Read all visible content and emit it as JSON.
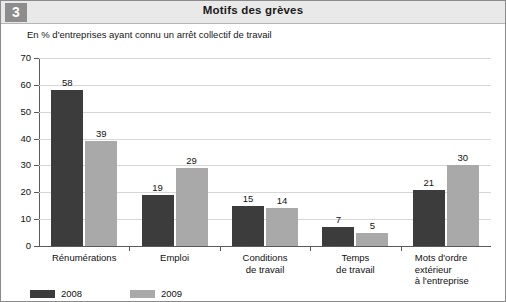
{
  "badge": {
    "number": "3"
  },
  "header": {
    "title": "Motifs des grèves"
  },
  "subtitle": "En % d'entreprises ayant connu un arrêt collectif de travail",
  "legend": {
    "items": [
      {
        "label": "2008",
        "color": "#3c3c3c"
      },
      {
        "label": "2009",
        "color": "#a9a9a9"
      }
    ]
  },
  "chart_data": {
    "type": "bar",
    "title": "Motifs des grèves",
    "subtitle": "En % d'entreprises ayant connu un arrêt collectif de travail",
    "xlabel": "",
    "ylabel": "",
    "ylim": [
      0,
      70
    ],
    "yticks": [
      0,
      10,
      20,
      30,
      40,
      50,
      60,
      70
    ],
    "ytick_labels": [
      "0",
      "10",
      "20",
      "30",
      "40",
      "50",
      "60",
      "70"
    ],
    "grid": true,
    "legend_position": "bottom-left",
    "categories": [
      "Rénumérations",
      "Emploi",
      "Conditions de travail",
      "Temps de travail",
      "Mots d'ordre extérieur à l'entreprise"
    ],
    "category_lines": [
      [
        "Rénumérations"
      ],
      [
        "Emploi"
      ],
      [
        "Conditions",
        "de travail"
      ],
      [
        "Temps",
        "de travail"
      ],
      [
        "Mots d'ordre",
        "extérieur",
        "à l'entreprise"
      ]
    ],
    "series": [
      {
        "name": "2008",
        "color": "#3c3c3c",
        "values": [
          58,
          19,
          15,
          7,
          21
        ]
      },
      {
        "name": "2009",
        "color": "#a9a9a9",
        "values": [
          39,
          29,
          14,
          5,
          30
        ]
      }
    ]
  }
}
